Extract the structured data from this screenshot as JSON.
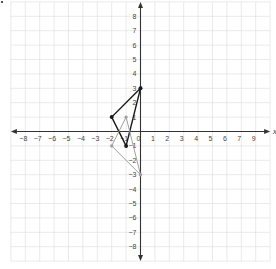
{
  "graph": {
    "x_axis_label": "x",
    "y_axis_label": "y",
    "x_range": [
      -9,
      9
    ],
    "y_range": [
      -9,
      9
    ],
    "x_tick_labels": [
      "−8",
      "−7",
      "−6",
      "−5",
      "−4",
      "−3",
      "−2",
      "−1",
      "0",
      "1",
      "2",
      "3",
      "4",
      "5",
      "6",
      "7",
      "9"
    ],
    "x_tick_values": [
      -8,
      -7,
      -6,
      -5,
      -4,
      -3,
      -2,
      -1,
      0,
      1,
      2,
      3,
      4,
      5,
      6,
      7,
      8
    ],
    "y_tick_labels": [
      "8",
      "7",
      "6",
      "5",
      "4",
      "3",
      "2",
      "1",
      "−1",
      "−2",
      "−3",
      "−4",
      "−5",
      "−6",
      "−7",
      "−8"
    ],
    "y_tick_values": [
      8,
      7,
      6,
      5,
      4,
      3,
      2,
      1,
      -1,
      -2,
      -3,
      -4,
      -5,
      -6,
      -7,
      -8
    ],
    "grid": true,
    "colors": {
      "grid": "#dcdcdc",
      "axis": "#333333",
      "preimage": "#1a1a1a",
      "image": "#a0a0a0"
    },
    "shapes": [
      {
        "name": "preimage-triangle",
        "color": "#1a1a1a",
        "vertices": [
          [
            0,
            3
          ],
          [
            -2,
            1
          ],
          [
            -1,
            -1
          ]
        ]
      },
      {
        "name": "image-triangle",
        "color": "#a0a0a0",
        "vertices": [
          [
            -1,
            1
          ],
          [
            -2,
            -1
          ],
          [
            0,
            -3
          ]
        ]
      }
    ]
  }
}
